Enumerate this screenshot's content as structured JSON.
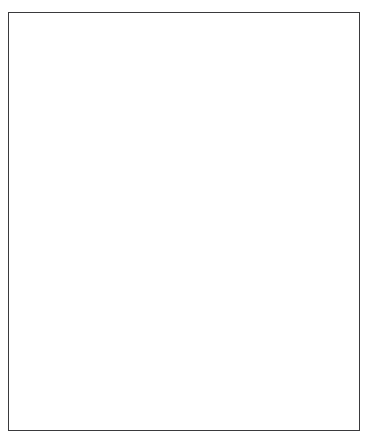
{
  "figure": {
    "domain": "anatomical-illustration",
    "medium": "grayscale pen-and-ink / graphite rendering",
    "background_color": "#ffffff",
    "frame": {
      "present": true,
      "stroke_color": "#3a3a3d",
      "stroke_width_px": 1.6,
      "x": 8,
      "y": 12,
      "width": 352,
      "height": 419
    },
    "canvas": {
      "width": 370,
      "height": 439
    },
    "visible_text": [],
    "labels": [],
    "caption": ""
  },
  "palette": {
    "paper_white": "#ffffff",
    "bone_light": "#f3f2f0",
    "bone_midtone": "#cfccc7",
    "bone_shadow": "#8e8b86",
    "outline_dark": "#262629",
    "outline_mid": "#4a4a4e",
    "muscle_dark": "#2f2f31",
    "muscle_mid": "#55555a",
    "muscle_highlight": "#8d8d92",
    "frame_gray": "#3a3a3d"
  },
  "structures": {
    "humerus": {
      "name": "Humerus (distal shaft and condyles)",
      "region": "upper-frame",
      "rendering": "outline only at shaft, shaded at condyles",
      "cut_off_at_top": true
    },
    "elbow_joint": {
      "name": "Elbow joint",
      "parts": [
        "medial epicondyle",
        "lateral epicondyle",
        "trochlea",
        "capitulum",
        "olecranon",
        "radial head"
      ]
    },
    "radius": {
      "name": "Radius",
      "side": "lateral / thumb side",
      "rendering": "light bone tone with outline"
    },
    "ulna": {
      "name": "Ulna",
      "side": "medial / little-finger side",
      "rendering": "light bone tone with outline, partly overlapped by muscle"
    },
    "carpus": {
      "name": "Carpal bones",
      "count": 8,
      "rendering": "small clustered bones at the wrist"
    },
    "metacarpals": {
      "name": "Metacarpals",
      "count": 5
    },
    "phalanges": {
      "name": "Phalanges",
      "digits": 5,
      "note": "thumb has two phalanges; fingers two through five have three each"
    },
    "highlighted_muscle": {
      "name": "Highlighted forearm muscle",
      "fill": "#2f2f31",
      "course": "from the epicondylar region of the humerus, along the ulnar border of the forearm, tapering to a tendon at the wrist",
      "shading": "longitudinal striations, dark belly with lighter lateral highlight",
      "emphasis": "solid dark tone contrasting with the pale bone"
    }
  },
  "view": {
    "orientation": "anterior",
    "limb": "right upper limb",
    "pose": "extended elbow, fingers spread and pointing downward"
  }
}
